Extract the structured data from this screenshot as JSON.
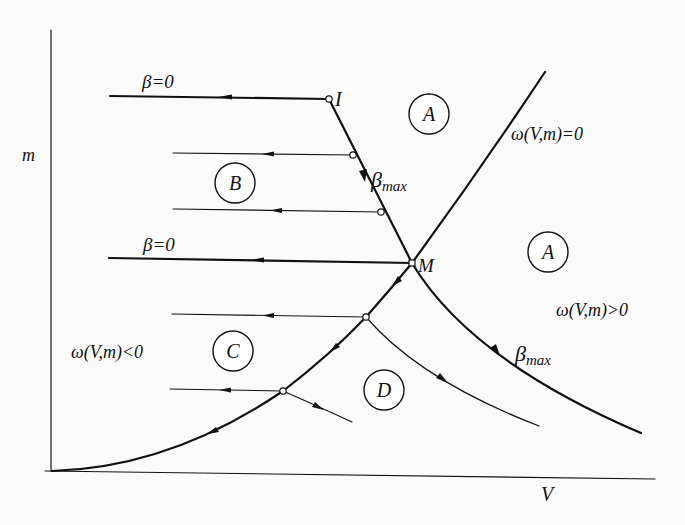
{
  "figure": {
    "axes": {
      "x_label": "V",
      "y_label": "m"
    },
    "curves": {
      "omega_zero_label": "ω(V,m)=0",
      "omega_positive_label": "ω(V,m)>0",
      "omega_negative_label": "ω(V,m)<0"
    },
    "path_labels": {
      "beta_zero_top": "β=0",
      "beta_zero_middle": "β=0",
      "beta_max_upper_symbol": "β",
      "beta_max_upper_sub": "max",
      "beta_max_lower_symbol": "β",
      "beta_max_lower_sub": "max"
    },
    "points": {
      "I": "I",
      "M": "M"
    },
    "regions": {
      "A_upper": "A",
      "A_right": "A",
      "B": "B",
      "C": "C",
      "D": "D"
    },
    "colors": {
      "ink": "#111111",
      "background": "#fbfbfb"
    }
  }
}
